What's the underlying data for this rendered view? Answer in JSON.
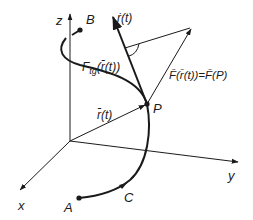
{
  "diagram": {
    "type": "vector-field-along-curve",
    "colors": {
      "ink": "#1a1a1a",
      "background": "#ffffff"
    },
    "axes": {
      "x_label": "x",
      "y_label": "y",
      "z_label": "z"
    },
    "points": {
      "A": "A",
      "B": "B",
      "C": "C",
      "P": "P"
    },
    "labels": {
      "tangent": "ṙ(t)",
      "tangent_vec_bar": "→",
      "position": "r̄(t)",
      "force_tangential": "F",
      "force_tangential_sub": "tg",
      "force_tangential_arg": "(r̄(t))",
      "force_full": "F̄(r̄(t))=F̄(P)"
    }
  }
}
